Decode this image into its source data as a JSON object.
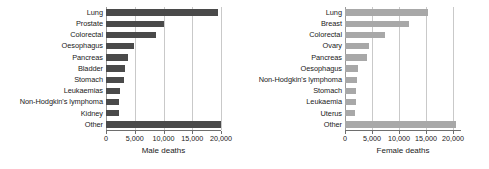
{
  "chart_data": [
    {
      "type": "bar",
      "orientation": "horizontal",
      "panel": "left",
      "title": "",
      "xlabel": "Male deaths",
      "ylabel": "",
      "xlim": [
        0,
        20000
      ],
      "xticks": [
        0,
        5000,
        10000,
        15000,
        20000
      ],
      "xticklabels": [
        "0",
        "5,000",
        "10,000",
        "15,000",
        "20,000"
      ],
      "grid": true,
      "grid_axis": "x",
      "legend": "none",
      "bar_color": "#4a4a4a",
      "categories": [
        "Lung",
        "Prostate",
        "Colorectal",
        "Oesophagus",
        "Pancreas",
        "Bladder",
        "Stomach",
        "Leukaemias",
        "Non-Hodgkin's lymphoma",
        "Kidney",
        "Other"
      ],
      "values": [
        19500,
        10000,
        8700,
        4900,
        3900,
        3300,
        3200,
        2400,
        2300,
        2200,
        20000
      ]
    },
    {
      "type": "bar",
      "orientation": "horizontal",
      "panel": "right",
      "title": "",
      "xlabel": "Female deaths",
      "ylabel": "",
      "xlim": [
        0,
        21500
      ],
      "xticks": [
        0,
        5000,
        10000,
        15000,
        20000
      ],
      "xticklabels": [
        "0",
        "5,000",
        "10,000",
        "15,000",
        "20,000"
      ],
      "grid": true,
      "grid_axis": "x",
      "legend": "none",
      "bar_color": "#a8a8a8",
      "categories": [
        "Lung",
        "Breast",
        "Colorectal",
        "Ovary",
        "Pancreas",
        "Oesophagus",
        "Non-Hodgkin's lymphoma",
        "Stomach",
        "Leukaemia",
        "Uterus",
        "Other"
      ],
      "values": [
        15400,
        11900,
        7500,
        4400,
        4100,
        2500,
        2200,
        2000,
        1950,
        1800,
        20500
      ]
    }
  ]
}
